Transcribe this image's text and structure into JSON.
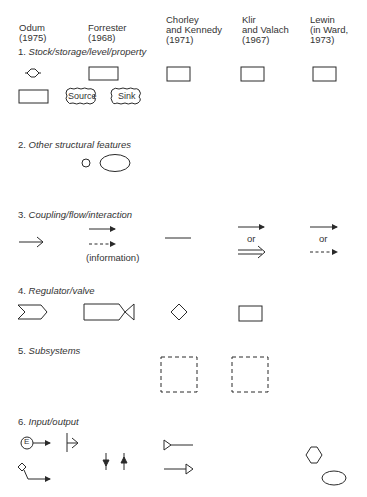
{
  "figure": {
    "columns": [
      {
        "id": "odum",
        "label": "Odum\n(1975)"
      },
      {
        "id": "forrester",
        "label": "Forrester\n(1968)"
      },
      {
        "id": "chorley",
        "label": "Chorley\nand Kennedy\n(1971)"
      },
      {
        "id": "klir",
        "label": "Klir\nand Valach\n(1967)"
      },
      {
        "id": "lewin",
        "label": "Lewin\n(in Ward,\n1973)"
      }
    ],
    "sections": [
      {
        "number": "1.",
        "title": "Stock/storage/level/property",
        "symbols": {
          "odum": [
            "circle-with-side-points",
            "rectangle"
          ],
          "forrester": [
            "rectangle",
            "cloud-source",
            "cloud-sink"
          ],
          "chorley": [
            "rectangle"
          ],
          "klir": [
            "rectangle"
          ],
          "lewin": [
            "rectangle"
          ]
        },
        "labels": {
          "source": "Source",
          "sink": "Sink"
        }
      },
      {
        "number": "2.",
        "title": "Other structural features",
        "symbols": {
          "forrester": [
            "small-circle",
            "ellipse"
          ]
        }
      },
      {
        "number": "3.",
        "title": "Coupling/flow/interaction",
        "symbols": {
          "odum": [
            "open-arrow"
          ],
          "forrester": [
            "solid-arrow",
            "dashed-arrow"
          ],
          "chorley": [
            "plain-line"
          ],
          "klir": [
            "solid-arrow",
            "double-line-arrow"
          ],
          "lewin": [
            "solid-arrow",
            "dashed-arrow"
          ]
        },
        "labels": {
          "information": "(information)",
          "or_klir": "or",
          "or_lewin": "or"
        }
      },
      {
        "number": "4.",
        "title": "Regulator/valve",
        "symbols": {
          "odum": [
            "chevron"
          ],
          "forrester": [
            "valve-bowtie"
          ],
          "chorley": [
            "diamond"
          ],
          "klir": [
            "rectangle"
          ]
        }
      },
      {
        "number": "5.",
        "title": "Subsystems",
        "symbols": {
          "chorley": [
            "dashed-square"
          ],
          "klir": [
            "dashed-square"
          ]
        }
      },
      {
        "number": "6.",
        "title": "Input/output",
        "symbols": {
          "odum": [
            "energy-source-arrow",
            "storage-outflow-arrow"
          ],
          "forrester": [
            "bar-open-arrow",
            "down-arrow",
            "up-arrow"
          ],
          "chorley": [
            "triangle-line-input",
            "line-triangle-output"
          ],
          "lewin": [
            "hexagon",
            "ellipse"
          ]
        },
        "labels": {
          "energy": "E"
        }
      }
    ]
  },
  "colors": {
    "ink": "#2a2a2a",
    "background": "#ffffff"
  }
}
